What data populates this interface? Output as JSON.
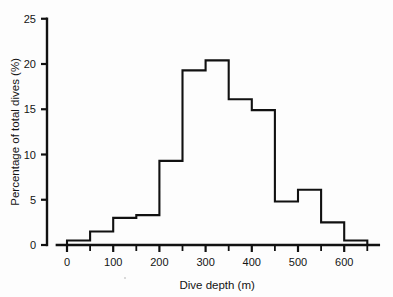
{
  "chart_data": {
    "type": "bar",
    "title": "",
    "subtitle": "",
    "xlabel": "Dive depth (m)",
    "ylabel": "Percentage of total dives (%)",
    "xlim": [
      -25,
      675
    ],
    "ylim": [
      0,
      25
    ],
    "grid": false,
    "legend": null,
    "bin_width": 50,
    "categories": [
      "0-50",
      "50-100",
      "100-150",
      "150-200",
      "200-250",
      "250-300",
      "300-350",
      "350-400",
      "400-450",
      "450-500",
      "500-550",
      "550-600",
      "600-650"
    ],
    "bin_edges": [
      0,
      50,
      100,
      150,
      200,
      250,
      300,
      350,
      400,
      450,
      500,
      550,
      600,
      650
    ],
    "values": [
      0.5,
      1.5,
      3.0,
      3.3,
      9.3,
      19.3,
      20.4,
      16.1,
      14.9,
      4.8,
      6.1,
      2.5,
      0.5
    ],
    "x_ticks_major": [
      0,
      100,
      200,
      300,
      400,
      500,
      600
    ],
    "x_tick_labels": [
      "0",
      "100",
      "200",
      "300",
      "400",
      "500",
      "600"
    ],
    "x_ticks_minor": [
      50,
      150,
      250,
      350,
      450,
      550,
      650
    ],
    "y_ticks": [
      0,
      5,
      10,
      15,
      20,
      25
    ],
    "y_tick_labels": [
      "0",
      "5",
      "10",
      "15",
      "20",
      "25"
    ],
    "series_color": "#111111",
    "bar_fill": "#ffffff"
  },
  "axes": {
    "x_title": "Dive depth (m)",
    "y_title": "Percentage of total dives (%)"
  }
}
